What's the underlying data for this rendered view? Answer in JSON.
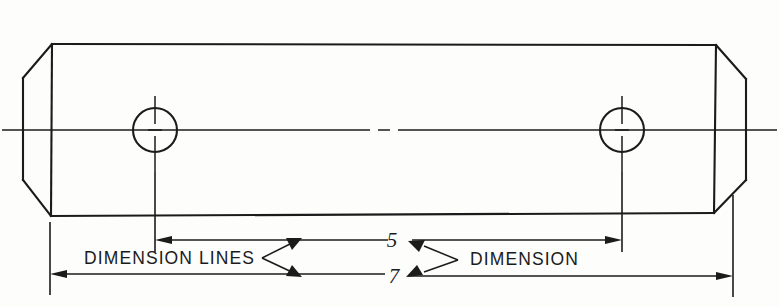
{
  "drawing": {
    "title": "Dimensioning example — chamfered plate with two holes",
    "background_color": "#fdfdfc",
    "line_color": "#1b1b1b",
    "annotations": {
      "dimension_lines_label": "DIMENSION LINES",
      "dimension_label": "DIMENSION"
    },
    "dimensions": [
      {
        "id": "hole-spacing",
        "value": "5",
        "kind": "linear",
        "between": "left-hole-center to right-hole-center"
      },
      {
        "id": "overall-length",
        "value": "7",
        "kind": "linear",
        "between": "left-face to right-face"
      }
    ],
    "features": {
      "plate": {
        "name": "chamfered-plate",
        "top_edge_y": 44,
        "bottom_edge_y": 215,
        "left_face_x": 30,
        "right_face_x": 733,
        "chamfer": "four corners"
      },
      "holes": [
        {
          "name": "left-hole",
          "cx": 155,
          "cy": 130,
          "r": 22
        },
        {
          "name": "right-hole",
          "cx": 622,
          "cy": 130,
          "r": 22
        }
      ],
      "centerline_y": 130
    }
  }
}
